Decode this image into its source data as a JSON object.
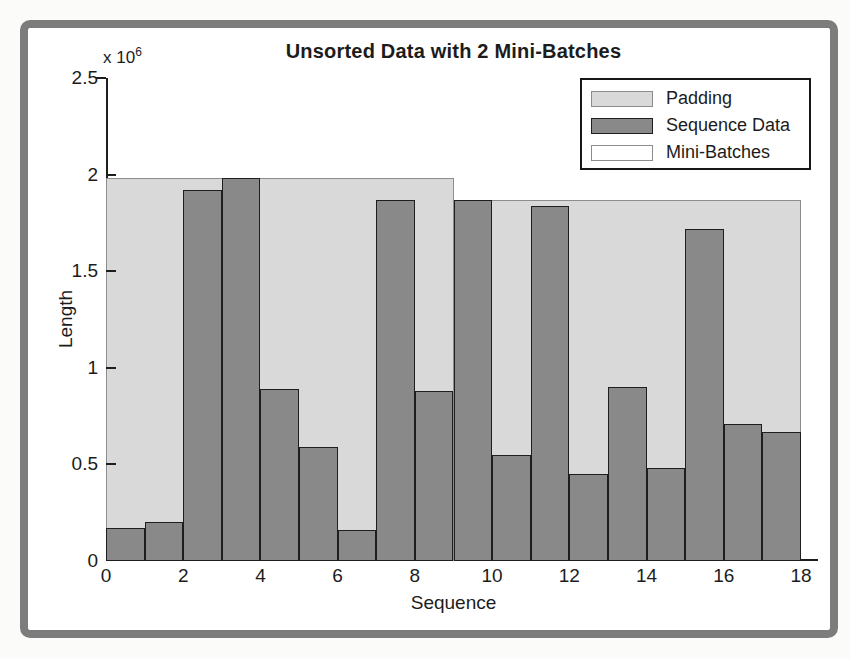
{
  "page": {
    "background": "#fbfbfa"
  },
  "figure": {
    "frame_color": "#7c7c7c",
    "background": "#ffffff"
  },
  "chart_data": {
    "type": "bar",
    "title": "Unsorted Data with 2 Mini-Batches",
    "xlabel": "Sequence",
    "ylabel": "Length",
    "y_axis_multiplier_text": "x 10",
    "y_axis_multiplier_exponent": "6",
    "unit_multiplier": 1000000,
    "xlim": [
      0,
      18
    ],
    "ylim": [
      0,
      2.5
    ],
    "grid": false,
    "x_tick_values": [
      0,
      2,
      4,
      6,
      8,
      10,
      12,
      14,
      16,
      18
    ],
    "x_tick_labels": [
      "0",
      "2",
      "4",
      "6",
      "8",
      "10",
      "12",
      "14",
      "16",
      "18"
    ],
    "y_tick_values": [
      0,
      0.5,
      1,
      1.5,
      2,
      2.5
    ],
    "y_tick_labels": [
      "0",
      "0.5",
      "1",
      "1.5",
      "2",
      "2.5"
    ],
    "legend": {
      "position": "top-right",
      "entries": [
        {
          "label": "Padding",
          "fill": "#d9d9d9",
          "edge": "#8d8d8d"
        },
        {
          "label": "Sequence Data",
          "fill": "#898989",
          "edge": "#1e1e1e"
        },
        {
          "label": "Mini-Batches",
          "fill": "#ffffff",
          "edge": "#8d8d8d"
        }
      ]
    },
    "series": [
      {
        "name": "Padding",
        "render": "background-blocks",
        "fill": "#d9d9d9",
        "edge": "#8d8d8d",
        "blocks": [
          {
            "x_start": 0,
            "x_end": 9,
            "height": 1.98
          },
          {
            "x_start": 9,
            "x_end": 18,
            "height": 1.87
          }
        ]
      },
      {
        "name": "Sequence Data",
        "render": "bars",
        "fill": "#898989",
        "edge": "#1e1e1e",
        "bar_width": 1,
        "x_starts": [
          0,
          1,
          2,
          3,
          4,
          5,
          6,
          7,
          8,
          9,
          10,
          11,
          12,
          13,
          14,
          15,
          16,
          17
        ],
        "values": [
          0.17,
          0.2,
          1.92,
          1.98,
          0.89,
          0.59,
          0.16,
          1.87,
          0.88,
          1.87,
          0.55,
          1.84,
          0.45,
          0.9,
          0.48,
          1.72,
          0.71,
          0.67
        ]
      }
    ]
  }
}
